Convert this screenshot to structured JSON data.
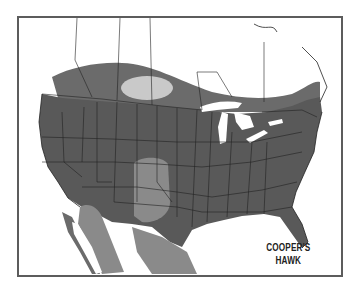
{
  "map": {
    "title_line1": "COOPER'S",
    "title_line2": "HAWK",
    "region": "North America (USA, southern Canada, northern Mexico)",
    "colors": {
      "year_round": "#595959",
      "breeding": "#6b6b6b",
      "winter": "#8a8a8a",
      "pale_patch": "#c9c9c9",
      "land_outside_range": "#ffffff",
      "water": "#ffffff",
      "borders": "#222222",
      "frame": "#5c5c5c"
    },
    "legend": []
  }
}
